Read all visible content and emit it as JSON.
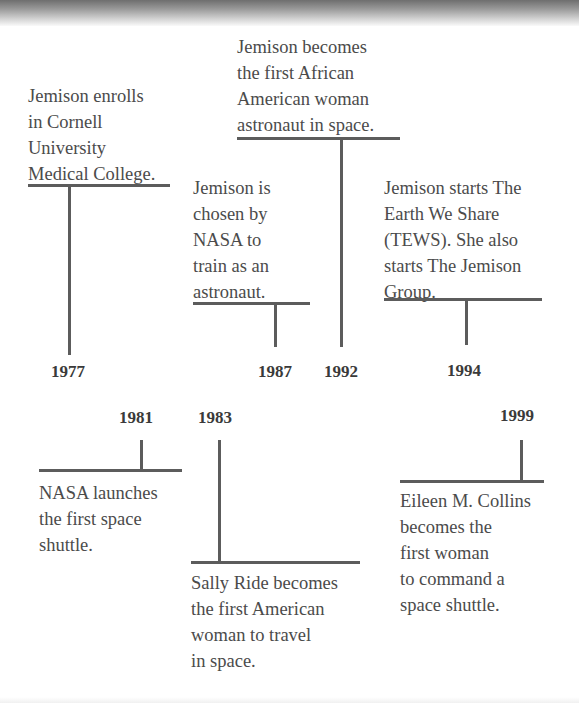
{
  "timeline": {
    "above": [
      {
        "year": "1977",
        "text": "Jemison enrolls\nin Cornell\nUniversity\nMedical College."
      },
      {
        "year": "1987",
        "text": "Jemison is\nchosen by\nNASA to\ntrain as an\nastronaut."
      },
      {
        "year": "1992",
        "text": "Jemison becomes\nthe first African\nAmerican woman\nastronaut in space."
      },
      {
        "year": "1994",
        "text": "Jemison starts The\nEarth We Share\n(TEWS). She also\nstarts The Jemison\nGroup."
      }
    ],
    "below": [
      {
        "year": "1981",
        "text": "NASA launches\nthe first space\nshuttle."
      },
      {
        "year": "1983",
        "text": "Sally Ride becomes\nthe first American\nwoman to travel\nin space."
      },
      {
        "year": "1999",
        "text": "Eileen M. Collins\nbecomes the\nfirst woman\nto command a\nspace shuttle."
      }
    ]
  },
  "colors": {
    "line": "#5c5c5c",
    "text": "#4b4b4b",
    "year": "#3a3a3a",
    "background": "#ffffff"
  }
}
